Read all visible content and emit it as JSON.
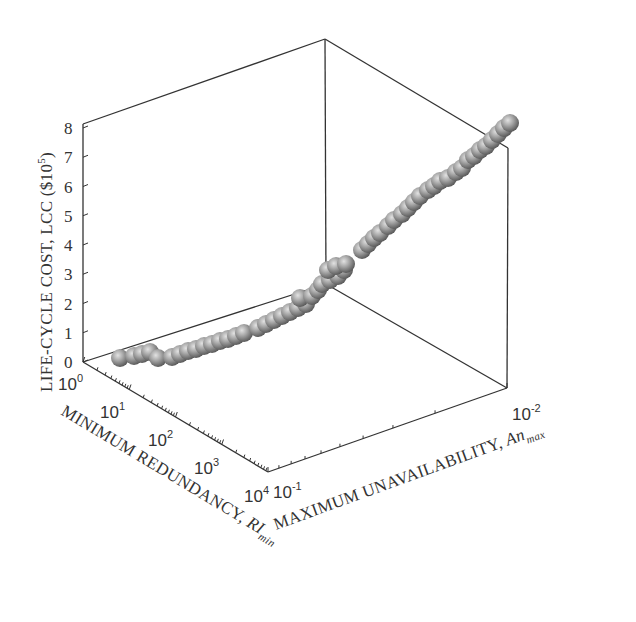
{
  "chart_data": {
    "type": "scatter3d",
    "title": "",
    "zlabel": "LIFE-CYCLE COST, LCC ($10⁵)",
    "zlabel_parts": {
      "text": "LIFE-CYCLE COST, LCC ($10",
      "sup": "5",
      "close": ")"
    },
    "xlabel": "MINIMUM REDUNDANCY, RI_min",
    "xlabel_parts": {
      "text": "MINIMUM REDUNDANCY, ",
      "var": "RI",
      "sub": "min"
    },
    "ylabel": "MAXIMUM UNAVAILABILITY, An_max",
    "ylabel_parts": {
      "text": "MAXIMUM UNAVAILABILITY, ",
      "var": "An",
      "sub": "max"
    },
    "z_ticks": [
      "0",
      "1",
      "2",
      "3",
      "4",
      "5",
      "6",
      "7",
      "8"
    ],
    "zlim": [
      0,
      8
    ],
    "x_ticks": [
      {
        "base": "10",
        "exp": "0"
      },
      {
        "base": "10",
        "exp": "1"
      },
      {
        "base": "10",
        "exp": "2"
      },
      {
        "base": "10",
        "exp": "3"
      },
      {
        "base": "10",
        "exp": "4"
      }
    ],
    "xlim": [
      1,
      10000
    ],
    "x_scale": "log",
    "y_ticks": [
      {
        "base": "10",
        "exp": "-1"
      },
      {
        "base": "10",
        "exp": "-2"
      }
    ],
    "ylim": [
      0.1,
      0.01
    ],
    "y_scale": "log",
    "grid": false,
    "legend": null,
    "marker": "shaded-sphere",
    "points_screen": [
      [
        120,
        358
      ],
      [
        134,
        356
      ],
      [
        142,
        354
      ],
      [
        150,
        352
      ],
      [
        158,
        358
      ],
      [
        172,
        357
      ],
      [
        180,
        354
      ],
      [
        188,
        351
      ],
      [
        196,
        349
      ],
      [
        204,
        346
      ],
      [
        212,
        344
      ],
      [
        220,
        341
      ],
      [
        228,
        339
      ],
      [
        236,
        336
      ],
      [
        244,
        333
      ],
      [
        258,
        328
      ],
      [
        266,
        324
      ],
      [
        274,
        320
      ],
      [
        282,
        316
      ],
      [
        290,
        312
      ],
      [
        298,
        308
      ],
      [
        306,
        304
      ],
      [
        300,
        298
      ],
      [
        312,
        296
      ],
      [
        318,
        290
      ],
      [
        322,
        284
      ],
      [
        330,
        280
      ],
      [
        338,
        276
      ],
      [
        344,
        270
      ],
      [
        328,
        270
      ],
      [
        336,
        266
      ],
      [
        346,
        264
      ],
      [
        362,
        250
      ],
      [
        368,
        244
      ],
      [
        374,
        238
      ],
      [
        380,
        233
      ],
      [
        388,
        226
      ],
      [
        394,
        220
      ],
      [
        402,
        214
      ],
      [
        408,
        208
      ],
      [
        414,
        202
      ],
      [
        420,
        196
      ],
      [
        428,
        190
      ],
      [
        434,
        186
      ],
      [
        440,
        181
      ],
      [
        448,
        178
      ],
      [
        456,
        172
      ],
      [
        462,
        168
      ],
      [
        468,
        160
      ],
      [
        474,
        156
      ],
      [
        480,
        150
      ],
      [
        486,
        146
      ],
      [
        492,
        140
      ],
      [
        498,
        134
      ],
      [
        504,
        128
      ],
      [
        510,
        123
      ]
    ],
    "approx_trend": {
      "description": "LCC increases monotonically from ~0.3 at (RI_min=10^0, An_max=10^-1) region toward ~8 at highest redundancy / lowest unavailability",
      "lcc_start": 0.3,
      "lcc_end": 7.8
    }
  }
}
